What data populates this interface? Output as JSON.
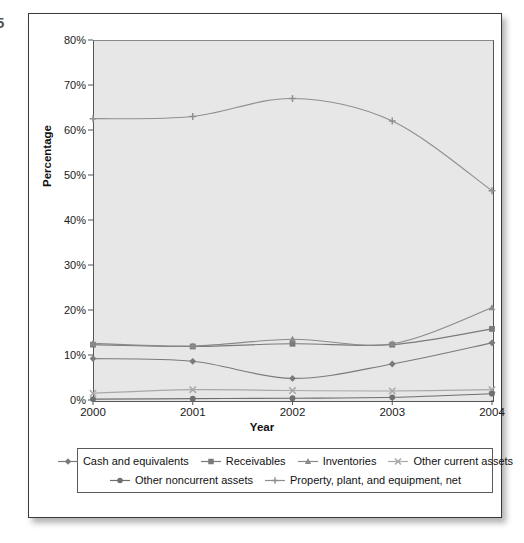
{
  "edge_glyph": "5",
  "axes": {
    "ylabel": "Percentage",
    "xlabel": "Year",
    "yticks": [
      "0%",
      "10%",
      "20%",
      "30%",
      "40%",
      "50%",
      "60%",
      "70%",
      "80%"
    ],
    "xticks": [
      "2000",
      "2001",
      "2002",
      "2003",
      "2004"
    ]
  },
  "legend": {
    "row1": [
      {
        "label": "Cash and equivalents",
        "marker": "diamond",
        "color": "#7a7a7a"
      },
      {
        "label": "Receivables",
        "marker": "square",
        "color": "#7a7a7a"
      },
      {
        "label": "Inventories",
        "marker": "triangle",
        "color": "#8a8a8a"
      },
      {
        "label": "Other current assets",
        "marker": "cross",
        "color": "#a8a8a8"
      }
    ],
    "row2": [
      {
        "label": "Other noncurrent assets",
        "marker": "circle",
        "color": "#6f6f6f"
      },
      {
        "label": "Property, plant, and equipment, net",
        "marker": "plus",
        "color": "#8f8f8f"
      }
    ]
  },
  "chart_data": {
    "type": "line",
    "title": "",
    "xlabel": "Year",
    "ylabel": "Percentage",
    "categories": [
      "2000",
      "2001",
      "2002",
      "2003",
      "2004"
    ],
    "x": [
      2000,
      2001,
      2002,
      2003,
      2004
    ],
    "ylim": [
      0,
      80
    ],
    "ytick_step": 10,
    "y_unit": "%",
    "grid": false,
    "legend_position": "bottom",
    "series": [
      {
        "name": "Cash and equivalents",
        "marker": "diamond",
        "color": "#7a7a7a",
        "values": [
          9.2,
          8.6,
          4.8,
          8.0,
          12.7
        ]
      },
      {
        "name": "Receivables",
        "marker": "square",
        "color": "#7a7a7a",
        "values": [
          12.3,
          11.9,
          12.5,
          12.3,
          15.8
        ]
      },
      {
        "name": "Inventories",
        "marker": "triangle",
        "color": "#8a8a8a",
        "values": [
          12.6,
          12.0,
          13.5,
          12.5,
          20.5
        ]
      },
      {
        "name": "Other current assets",
        "marker": "cross",
        "color": "#a8a8a8",
        "values": [
          1.5,
          2.3,
          2.1,
          2.0,
          2.3
        ]
      },
      {
        "name": "Other noncurrent assets",
        "marker": "circle",
        "color": "#6f6f6f",
        "values": [
          0.2,
          0.3,
          0.4,
          0.6,
          1.4
        ]
      },
      {
        "name": "Property, plant, and equipment, net",
        "marker": "plus",
        "color": "#8f8f8f",
        "values": [
          62.5,
          63.0,
          67.0,
          62.0,
          46.5
        ]
      }
    ]
  }
}
